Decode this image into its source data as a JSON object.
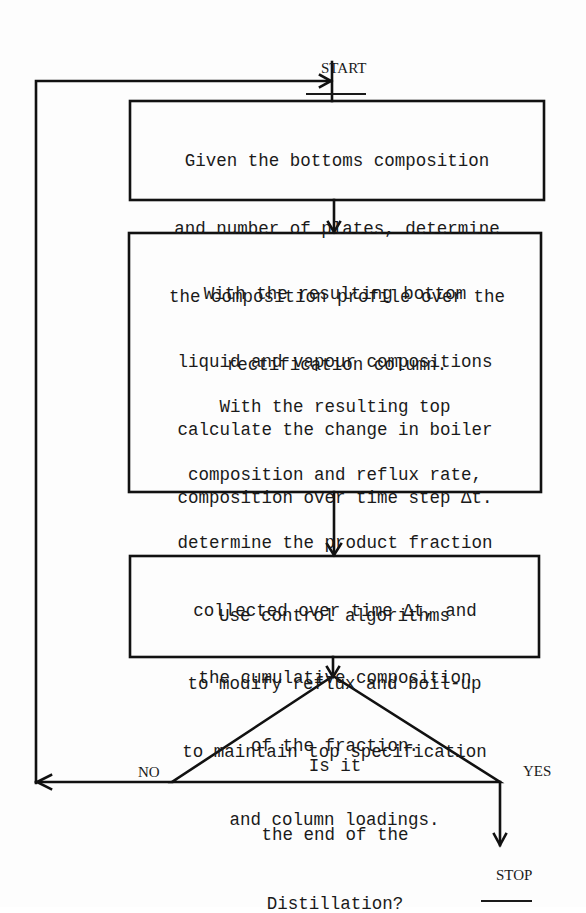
{
  "diagram": {
    "type": "flowchart",
    "start_label": "START",
    "stop_label": "STOP",
    "steps": [
      {
        "id": "step-1",
        "shape": "rectangle",
        "lines": [
          "Given the bottoms composition",
          "and number of plates, determine",
          "the composition profile over the",
          "rectification column."
        ]
      },
      {
        "id": "step-2",
        "shape": "rectangle",
        "paragraphs": [
          {
            "lines": [
              "With the resulting bottom",
              "liquid and vapour compositions",
              "calculate the change in boiler",
              "composition over time step Δt."
            ]
          },
          {
            "lines": [
              "With the resulting top",
              "composition and reflux rate,",
              "determine the product fraction",
              "collected over time Δt, and",
              "the cumulative composition",
              "of the fraction."
            ]
          }
        ]
      },
      {
        "id": "step-3",
        "shape": "rectangle",
        "lines": [
          "Use control algorithms",
          "to modify reflux and boil-up",
          "to maintain top specification",
          "and column loadings."
        ]
      }
    ],
    "decision": {
      "shape": "triangle",
      "lines": [
        "Is it",
        "the end of the",
        "Distillation?"
      ],
      "no_label": "NO",
      "yes_label": "YES"
    },
    "colors": {
      "stroke": "#111111",
      "text": "#1a1a1a",
      "background": "#fdfdfd"
    }
  }
}
